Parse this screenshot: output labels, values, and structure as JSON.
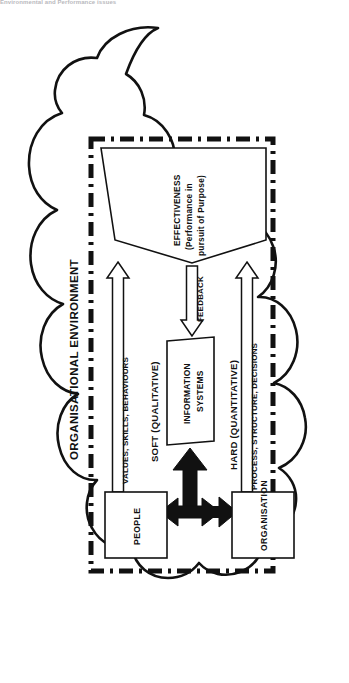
{
  "caption": {
    "text": "Environmental and Performance issues"
  },
  "diagram": {
    "type": "systems-diagram",
    "cloud_label": "ORGANISATIONAL ENVIRONMENT",
    "boundary_style": "dash-dot rectangle",
    "funnel": {
      "line1": "EFFECTIVENESS",
      "line2": "(Performance in",
      "line3": "pursuit of Purpose)"
    },
    "center_node": {
      "line1": "INFORMATION",
      "line2": "SYSTEMS",
      "shape": "parallelogram"
    },
    "feedback_arrow": {
      "label": "FEEDBACK",
      "direction": "down"
    },
    "left_branch": {
      "arrow_label": "VALUES, SKILLS, BEHAVIOURS",
      "category_label": "SOFT (QUALITATIVE)",
      "source_box": "PEOPLE",
      "direction": "up"
    },
    "right_branch": {
      "arrow_label": "PROCESS, STRUCTURE, DECISIONS",
      "category_label": "HARD (QUANTITATIVE)",
      "source_box": "ORGANISATION",
      "direction": "up"
    },
    "center_connector": {
      "shape": "bold-cross-arrow",
      "directions": "up, left, right"
    },
    "colors": {
      "stroke": "#111111",
      "fill": "#ffffff",
      "bold_arrow": "#111111",
      "caption": "#b9b9bd"
    }
  }
}
